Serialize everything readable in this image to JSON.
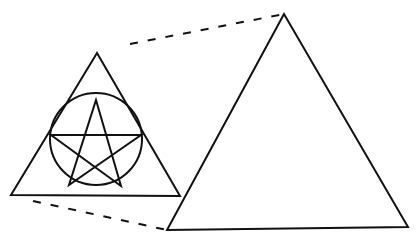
{
  "diagram": {
    "title": "",
    "stroke_color": "#111111",
    "background": "#ffffff",
    "small_triangle": {
      "points": [
        [
          97,
          53
        ],
        [
          11,
          195
        ],
        [
          180,
          196
        ]
      ]
    },
    "circle": {
      "cx": 96,
      "cy": 139,
      "r": 46
    },
    "pentagram": {
      "points": [
        [
          96,
          100
        ],
        [
          51,
          135
        ],
        [
          141,
          135
        ],
        [
          69,
          185
        ],
        [
          121,
          186
        ]
      ]
    },
    "large_triangle": {
      "points": [
        [
          284,
          14
        ],
        [
          167,
          230
        ],
        [
          408,
          227
        ]
      ]
    },
    "projection_lines": [
      {
        "from": [
          130,
          44
        ],
        "to": [
          284,
          14
        ],
        "style": "dashed"
      },
      {
        "from": [
          33,
          201
        ],
        "to": [
          167,
          230
        ],
        "style": "dashed"
      }
    ]
  }
}
